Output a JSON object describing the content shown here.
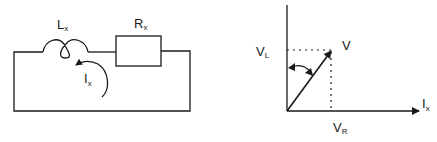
{
  "circuit": {
    "inductor": {
      "symbol": "L",
      "subscript": "x"
    },
    "resistor": {
      "symbol": "R",
      "subscript": "x"
    },
    "current": {
      "symbol": "I",
      "subscript": "x"
    }
  },
  "phasor": {
    "vertical_label": {
      "symbol": "V",
      "subscript": "L"
    },
    "resultant_label": {
      "symbol": "V",
      "subscript": ""
    },
    "horizontal_axis_label": {
      "symbol": "I",
      "subscript": "x"
    },
    "horizontal_component_label": {
      "symbol": "V",
      "subscript": "R"
    }
  },
  "colors": {
    "stroke": "#1a1a1a",
    "background": "#ffffff"
  }
}
